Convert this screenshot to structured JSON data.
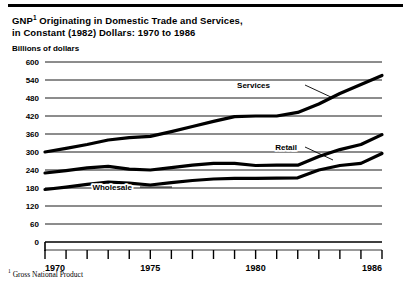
{
  "figure": {
    "title_line1": "GNP",
    "title_sup": "1",
    "title_line1_rest": " Originating in Domestic Trade and Services,",
    "title_line2": "in Constant (1982) Dollars:  1970 to 1986",
    "axis_units": "Billions of dollars",
    "footnote_sup": "1",
    "footnote_text": " Gross National Product"
  },
  "chart_data": {
    "type": "line",
    "xlabel": "",
    "ylabel": "Billions of dollars",
    "xlim": [
      1970,
      1986
    ],
    "ylim": [
      0,
      600
    ],
    "yticks": [
      0,
      60,
      120,
      180,
      240,
      300,
      360,
      420,
      480,
      540,
      600
    ],
    "ytick_labels": [
      "0",
      "60",
      "120",
      "180",
      "240",
      "300",
      "360",
      "420",
      "480",
      "540",
      "600"
    ],
    "xticks": [
      1970,
      1971,
      1972,
      1973,
      1974,
      1975,
      1976,
      1977,
      1978,
      1979,
      1980,
      1981,
      1982,
      1983,
      1984,
      1985,
      1986
    ],
    "xtick_labels_shown": [
      "1970",
      "1975",
      "1980",
      "1986"
    ],
    "grid": "horizontal",
    "legend": "inline-labels",
    "x": [
      1970,
      1971,
      1972,
      1973,
      1974,
      1975,
      1976,
      1977,
      1978,
      1979,
      1980,
      1981,
      1982,
      1983,
      1984,
      1985,
      1986
    ],
    "series": [
      {
        "name": "Services",
        "label": "Services",
        "values": [
          300,
          312,
          325,
          340,
          348,
          352,
          368,
          385,
          402,
          418,
          420,
          420,
          432,
          460,
          495,
          525,
          555
        ]
      },
      {
        "name": "Retail",
        "label": "Retail",
        "values": [
          230,
          238,
          247,
          252,
          243,
          240,
          248,
          256,
          262,
          262,
          255,
          256,
          256,
          285,
          308,
          325,
          358
        ]
      },
      {
        "name": "Wholesale",
        "label": "Wholesale",
        "values": [
          175,
          183,
          192,
          200,
          196,
          190,
          198,
          205,
          210,
          212,
          212,
          213,
          214,
          240,
          255,
          262,
          295
        ]
      }
    ]
  }
}
